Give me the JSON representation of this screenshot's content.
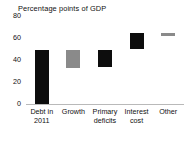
{
  "chart_data": {
    "type": "bar",
    "title": "Percentage points of GDP",
    "xlabel": "",
    "ylabel": "",
    "ylim": [
      0,
      80
    ],
    "yticks": [
      0,
      20,
      40,
      60,
      80
    ],
    "ytick_labels": [
      "0",
      "20",
      "40",
      "60",
      "80"
    ],
    "grid": false,
    "legend": false,
    "categories": [
      "Debt in 2011",
      "Growth",
      "Primary deficits",
      "Interest cost",
      "Other"
    ],
    "category_lines": [
      [
        "Debt in",
        "2011"
      ],
      [
        "Growth"
      ],
      [
        "Primary",
        "deficits"
      ],
      [
        "Interest",
        "cost"
      ],
      [
        "Other"
      ]
    ],
    "style": "waterfall",
    "bars": [
      {
        "label": "Debt in 2011",
        "base": 0,
        "top": 49,
        "value": 49,
        "color": "#0d0d0d"
      },
      {
        "label": "Growth",
        "base": 33,
        "top": 49,
        "value": 16,
        "color": "#8a8a8a"
      },
      {
        "label": "Primary deficits",
        "base": 34,
        "top": 49,
        "value": 15,
        "color": "#0d0d0d"
      },
      {
        "label": "Interest cost",
        "base": 50,
        "top": 65,
        "value": 15,
        "color": "#0d0d0d"
      },
      {
        "label": "Other",
        "base": 62,
        "top": 65,
        "value": 3,
        "color": "#8a8a8a"
      }
    ],
    "colors": {
      "dark_bar": "#0d0d0d",
      "light_bar": "#8a8a8a",
      "axis_line": "#b9b9b9",
      "text": "#111111",
      "background": "#ffffff"
    }
  }
}
